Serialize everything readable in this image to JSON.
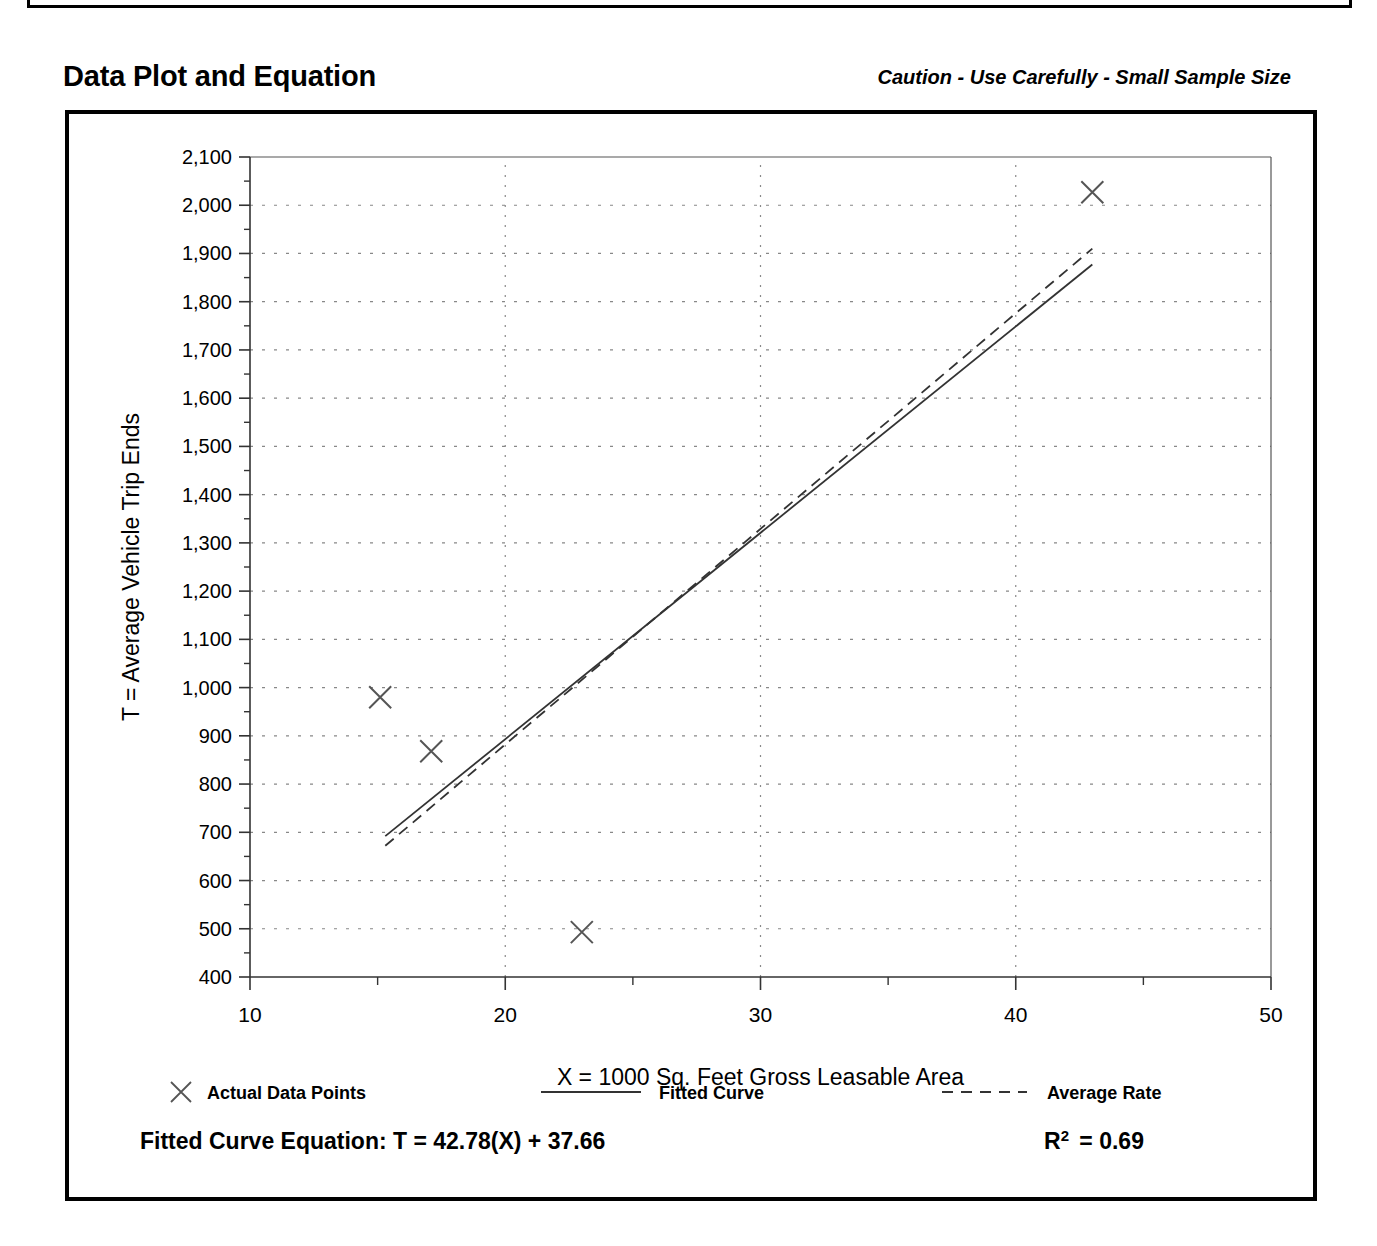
{
  "header": {
    "title": "Data Plot and Equation",
    "caution": "Caution - Use Carefully - Small Sample Size"
  },
  "footer": {
    "equation_label": "Fitted Curve Equation:",
    "equation": "T = 42.78(X) + 37.66",
    "r2_label": "R",
    "r2_exp": "2",
    "r2_value": "= 0.69"
  },
  "legend": {
    "items": [
      {
        "label": "Actual Data Points",
        "marker": "x-marker"
      },
      {
        "label": "Fitted Curve",
        "marker": "solid-line"
      },
      {
        "label": "Average Rate",
        "marker": "dashed-line"
      }
    ]
  },
  "chart_data": {
    "type": "scatter",
    "title": "Data Plot and Equation",
    "xlabel": "X = 1000 Sq. Feet Gross Leasable Area",
    "ylabel": "T = Average Vehicle Trip Ends",
    "xlim": [
      10,
      50
    ],
    "ylim": [
      400,
      2100
    ],
    "xticks": [
      10,
      20,
      30,
      40,
      50
    ],
    "xtick_labels": [
      "10",
      "20",
      "30",
      "40",
      "50"
    ],
    "xminor_step": 5,
    "yticks": [
      400,
      500,
      600,
      700,
      800,
      900,
      1000,
      1100,
      1200,
      1300,
      1400,
      1500,
      1600,
      1700,
      1800,
      1900,
      2000,
      2100
    ],
    "ytick_labels": [
      "400",
      "500",
      "600",
      "700",
      "800",
      "900",
      "1,000",
      "1,100",
      "1,200",
      "1,300",
      "1,400",
      "1,500",
      "1,600",
      "1,700",
      "1,800",
      "1,900",
      "2,000",
      "2,100"
    ],
    "yminor_step": 50,
    "grid": "dotted",
    "legend_position": "below-axis",
    "points": [
      {
        "x": 15.1,
        "y": 980
      },
      {
        "x": 17.1,
        "y": 868
      },
      {
        "x": 23.0,
        "y": 493
      },
      {
        "x": 43.0,
        "y": 2027
      }
    ],
    "series": [
      {
        "name": "Fitted Curve",
        "style": "solid",
        "equation": "T = 42.78(X) + 37.66",
        "r_squared": 0.69,
        "x": [
          15.3,
          43.0
        ],
        "y": [
          692,
          1877
        ]
      },
      {
        "name": "Average Rate",
        "style": "dashed",
        "x": [
          15.3,
          43.0
        ],
        "y": [
          672,
          1910
        ]
      }
    ]
  }
}
